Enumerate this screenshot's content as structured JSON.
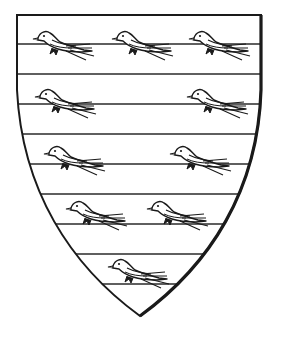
{
  "figure": {
    "colors": {
      "line": "#1a1a1a",
      "field": "#ffffff"
    },
    "shield": {
      "top_y": 15,
      "left_x": 17,
      "right_x": 261,
      "point": [
        140,
        316
      ]
    },
    "bars_y": [
      44,
      74,
      104,
      134,
      164,
      194,
      224,
      254,
      284
    ],
    "charges": {
      "name": "martlet-icon",
      "count": 10,
      "arrangement": "3, 2, 2, 2, 1",
      "positions": [
        [
          56,
          42
        ],
        [
          135,
          42
        ],
        [
          212,
          42
        ],
        [
          58,
          98
        ],
        [
          210,
          98
        ],
        [
          67,
          155
        ],
        [
          193,
          155
        ],
        [
          89,
          211
        ],
        [
          170,
          211
        ],
        [
          131,
          268
        ]
      ]
    }
  }
}
